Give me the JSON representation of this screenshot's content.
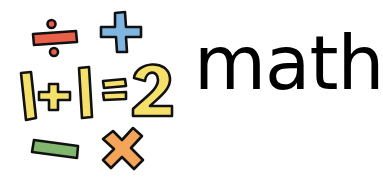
{
  "title": "math",
  "illustration": {
    "equation": "1+1=2",
    "symbols": [
      {
        "name": "divide",
        "glyph": "÷",
        "color": "#e8604a"
      },
      {
        "name": "plus",
        "glyph": "+",
        "color": "#7fb6e0"
      },
      {
        "name": "minus",
        "glyph": "−",
        "color": "#80b66e"
      },
      {
        "name": "multiply",
        "glyph": "×",
        "color": "#f4a55a"
      }
    ],
    "equation_color": "#f5e06a",
    "outline_color": "#111111"
  }
}
